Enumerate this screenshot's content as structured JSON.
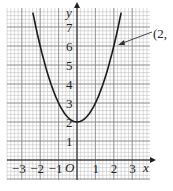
{
  "chart_data": {
    "type": "line",
    "title": "",
    "xlabel": "x",
    "ylabel": "y",
    "origin_label": "O",
    "xlim": [
      -3.8,
      4
    ],
    "ylim": [
      -1,
      8
    ],
    "x_ticks": [
      "-3",
      "-2",
      "-1",
      "1",
      "2",
      "3"
    ],
    "y_ticks": [
      "1",
      "2",
      "3",
      "4",
      "5",
      "6",
      "7"
    ],
    "grid": true,
    "series": [
      {
        "name": "y = x^2 + 2",
        "x": [
          -2.4,
          -2,
          -1.5,
          -1,
          -0.5,
          0,
          0.5,
          1,
          1.5,
          2,
          2.4
        ],
        "y": [
          7.76,
          6,
          4.25,
          3,
          2.25,
          2,
          2.25,
          3,
          4.25,
          6,
          7.76
        ]
      }
    ],
    "annotations": [
      {
        "text": "(2,",
        "points_to": [
          2,
          6
        ]
      }
    ]
  },
  "labels": {
    "y_axis": "y",
    "x_axis": "x",
    "origin": "O",
    "annotation": "(2,",
    "x_ticks": [
      "−3",
      "−2",
      "−1",
      "1",
      "2",
      "3"
    ],
    "y_ticks": [
      "1",
      "2",
      "3",
      "4",
      "5",
      "6",
      "7"
    ]
  }
}
